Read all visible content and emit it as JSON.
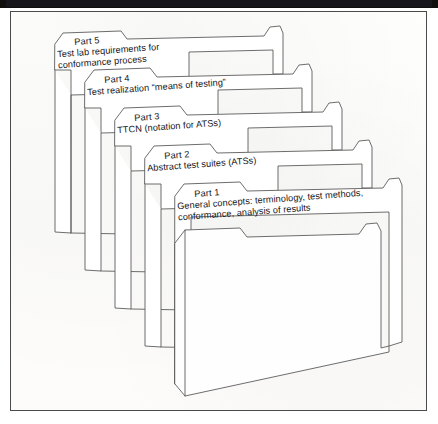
{
  "figure": {
    "title": "",
    "caption": "",
    "background_color": "#fdfdfc",
    "frame_color": "#4a4a4a",
    "line_color": "#5c5c5c",
    "text_color": "#16161a"
  },
  "diagram": {
    "type": "stacked-folders",
    "folder_count": 5,
    "stack_order_back_to_front": [
      "Part 5",
      "Part 4",
      "Part 3",
      "Part 2",
      "Part 1"
    ],
    "folders": [
      {
        "id": "folder-part-5",
        "part": "Part 5",
        "desc_line1": "Test lab requirements for",
        "desc_line2": "conformance process"
      },
      {
        "id": "folder-part-4",
        "part": "Part 4",
        "desc_line1": "Test realization “means of testing”",
        "desc_line2": ""
      },
      {
        "id": "folder-part-3",
        "part": "Part 3",
        "desc_line1": "TTCN (notation for ATSs)",
        "desc_line2": ""
      },
      {
        "id": "folder-part-2",
        "part": "Part 2",
        "desc_line1": "Abstract test suites (ATSs)",
        "desc_line2": ""
      },
      {
        "id": "folder-part-1",
        "part": "Part 1",
        "desc_line1": "General concepts: terminology, test methods,",
        "desc_line2": "conformance, analysis of results"
      }
    ]
  }
}
